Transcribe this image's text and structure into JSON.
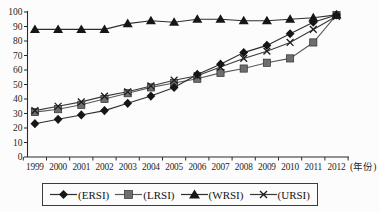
{
  "figure": {
    "background": "#fcfcfc",
    "axis_color": "#2b2b2b"
  },
  "chart_data": {
    "type": "line",
    "title": "",
    "xlabel": "(年份)",
    "ylabel": "",
    "ylim": [
      0,
      100
    ],
    "ytick_step": 10,
    "yticks": [
      0,
      10,
      20,
      30,
      40,
      50,
      60,
      70,
      80,
      90,
      100
    ],
    "grid": false,
    "legend_position": "bottom",
    "categories": [
      "1999",
      "2000",
      "2001",
      "2002",
      "2003",
      "2004",
      "2005",
      "2006",
      "2007",
      "2008",
      "2009",
      "2010",
      "2011",
      "2012"
    ],
    "series": [
      {
        "name": "ERSI",
        "label": "(ERSI)",
        "marker": "diamond",
        "color": "#161616",
        "line_color": "#2e2e2e",
        "values": [
          23,
          26,
          29,
          32,
          37,
          42,
          48,
          57,
          64,
          72,
          77,
          85,
          93,
          98
        ]
      },
      {
        "name": "LRSI",
        "label": "(LRSI)",
        "marker": "square",
        "color": "#6e6e6e",
        "line_color": "#5a5a5a",
        "values": [
          31,
          33,
          36,
          40,
          44,
          48,
          51,
          54,
          58,
          61,
          65,
          68,
          79,
          98
        ]
      },
      {
        "name": "WRSI",
        "label": "(WRSI)",
        "marker": "triangle",
        "color": "#161616",
        "line_color": "#2e2e2e",
        "values": [
          88,
          88,
          88,
          88,
          92,
          94,
          93,
          95,
          95,
          94,
          94,
          95,
          96,
          98
        ]
      },
      {
        "name": "URSI",
        "label": "(URSI)",
        "marker": "x",
        "color": "#1d1d1d",
        "line_color": "#3a3a3a",
        "values": [
          32,
          35,
          38,
          42,
          45,
          49,
          53,
          56,
          62,
          68,
          73,
          79,
          88,
          97
        ]
      }
    ]
  }
}
